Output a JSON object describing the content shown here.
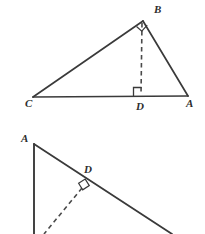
{
  "page": {
    "background_color": "#ffffff",
    "stroke_color": "#3a3a3a",
    "label_color": "#2e2e2e",
    "width": 205,
    "height": 234
  },
  "figures": [
    {
      "id": "figure-top",
      "name": "triangle-abc-with-altitude",
      "description": "Right triangle C-B-A with right angle at B and altitude BD drawn to hypotenuse CA",
      "points": {
        "C": {
          "x": 33,
          "y": 97,
          "label": "C",
          "label_x": 25,
          "label_y": 107
        },
        "A": {
          "x": 188,
          "y": 96,
          "label": "A",
          "label_x": 186,
          "label_y": 107
        },
        "B": {
          "x": 143,
          "y": 21,
          "label": "B",
          "label_x": 154,
          "label_y": 13
        },
        "D": {
          "x": 141,
          "y": 96,
          "label": "D",
          "label_x": 136,
          "label_y": 110
        }
      },
      "solid_segments": [
        {
          "name": "segment-CB",
          "from": "C",
          "to": "B"
        },
        {
          "name": "segment-BA",
          "from": "B",
          "to": "A"
        },
        {
          "name": "segment-CA",
          "from": "C",
          "to": "A"
        }
      ],
      "dashed_segments": [
        {
          "name": "altitude-BD",
          "from": "B",
          "to": "D"
        }
      ],
      "right_angle_marks": [
        {
          "name": "right-angle-at-B",
          "vertex": "B"
        },
        {
          "name": "right-angle-at-D",
          "vertex": "D"
        }
      ]
    },
    {
      "id": "figure-bottom",
      "name": "partial-triangle-with-altitude-foot-D",
      "description": "Partially cropped figure: vertex A at upper left with vertical leg descending off-frame and a hypotenuse descending to the right; D is the foot of a dashed perpendicular meeting the hypotenuse at a right angle",
      "points": {
        "A": {
          "x": 34,
          "y": 144,
          "label": "A",
          "label_x": 21,
          "label_y": 142
        },
        "D": {
          "x": 84,
          "y": 186,
          "label": "D",
          "label_x": 84,
          "label_y": 173
        }
      },
      "solid_segments": [
        {
          "name": "vertical-leg-from-A",
          "from_x": 34,
          "from_y": 144,
          "to_x": 34,
          "to_y": 234
        },
        {
          "name": "hypotenuse-through-D",
          "from_x": 34,
          "from_y": 144,
          "to_x": 172,
          "to_y": 234
        }
      ],
      "dashed_segments": [
        {
          "name": "altitude-to-D",
          "from_x": 84,
          "from_y": 186,
          "to_x": 44,
          "to_y": 234
        }
      ],
      "right_angle_marks": [
        {
          "name": "right-angle-at-D",
          "vertex": "D"
        }
      ]
    }
  ]
}
